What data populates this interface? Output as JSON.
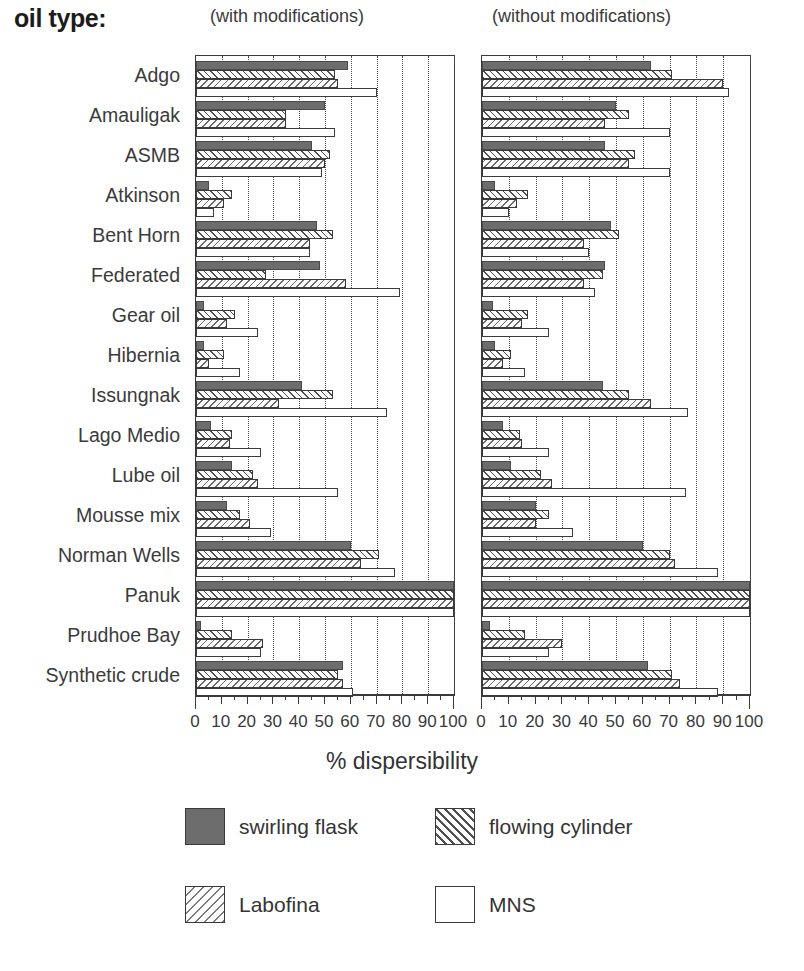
{
  "header": {
    "oil_type_label": "oil type:",
    "caption_left": "(with modifications)",
    "caption_right": "(without modifications)"
  },
  "axis": {
    "xlabel": "% dispersibility",
    "ticks": [
      0,
      10,
      20,
      30,
      40,
      50,
      60,
      70,
      80,
      90,
      100
    ],
    "xmin": 0,
    "xmax": 100
  },
  "legend": {
    "position": "bottom",
    "entries": [
      {
        "label": "swirling flask",
        "pattern": "solid-dark"
      },
      {
        "label": "flowing cylinder",
        "pattern": "hatch-forward"
      },
      {
        "label": "Labofina",
        "pattern": "hatch-back"
      },
      {
        "label": "MNS",
        "pattern": "empty-white"
      }
    ]
  },
  "chart_data": {
    "type": "bar",
    "orientation": "horizontal",
    "title": "",
    "xlabel": "% dispersibility",
    "ylabel": "oil type:",
    "xlim": [
      0,
      100
    ],
    "grid": true,
    "categories": [
      "Adgo",
      "Amauligak",
      "ASMB",
      "Atkinson",
      "Bent Horn",
      "Federated",
      "Gear oil",
      "Hibernia",
      "Issungnak",
      "Lago Medio",
      "Lube oil",
      "Mousse mix",
      "Norman Wells",
      "Panuk",
      "Prudhoe Bay",
      "Synthetic crude"
    ],
    "panels": [
      {
        "name": "with modifications",
        "series": [
          {
            "name": "swirling flask",
            "values": [
              59,
              50,
              45,
              5,
              47,
              48,
              3,
              3,
              41,
              6,
              14,
              12,
              60,
              100,
              2,
              57
            ]
          },
          {
            "name": "flowing cylinder",
            "values": [
              54,
              35,
              52,
              14,
              53,
              27,
              15,
              11,
              53,
              14,
              22,
              17,
              71,
              100,
              14,
              55
            ]
          },
          {
            "name": "Labofina",
            "values": [
              55,
              35,
              50,
              11,
              44,
              58,
              12,
              5,
              32,
              13,
              24,
              21,
              64,
              100,
              26,
              57
            ]
          },
          {
            "name": "MNS",
            "values": [
              70,
              54,
              49,
              7,
              44,
              79,
              24,
              17,
              74,
              25,
              55,
              29,
              77,
              100,
              25,
              61
            ]
          }
        ]
      },
      {
        "name": "without modifications",
        "series": [
          {
            "name": "swirling flask",
            "values": [
              63,
              50,
              46,
              5,
              48,
              46,
              4,
              5,
              45,
              8,
              11,
              20,
              60,
              100,
              3,
              62
            ]
          },
          {
            "name": "flowing cylinder",
            "values": [
              71,
              55,
              57,
              17,
              51,
              45,
              17,
              11,
              55,
              14,
              22,
              25,
              70,
              100,
              16,
              71
            ]
          },
          {
            "name": "Labofina",
            "values": [
              90,
              46,
              55,
              13,
              38,
              38,
              15,
              8,
              63,
              15,
              26,
              20,
              72,
              100,
              30,
              74
            ]
          },
          {
            "name": "MNS",
            "values": [
              92,
              70,
              70,
              10,
              40,
              42,
              25,
              16,
              77,
              25,
              76,
              34,
              88,
              100,
              25,
              88
            ]
          }
        ]
      }
    ]
  }
}
